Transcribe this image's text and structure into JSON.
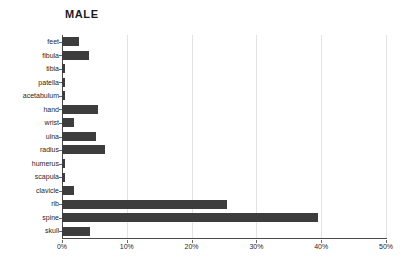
{
  "chart_data": {
    "type": "bar",
    "orientation": "horizontal",
    "title": "MALE",
    "xlabel": "",
    "ylabel": "",
    "xlim": [
      0,
      50
    ],
    "xtick_labels": [
      "0%",
      "10%",
      "20%",
      "30%",
      "40%",
      "50%"
    ],
    "xtick_values": [
      0,
      10,
      20,
      30,
      40,
      50
    ],
    "grid": true,
    "legend": false,
    "bar_color": "#3d3d3d",
    "axis_color": "#4a4a4a",
    "gridline_color": "#e3e3e3",
    "background_color": "#ffffff",
    "value_unit": "percent",
    "categories": [
      "feet",
      "fibula",
      "tibia",
      "patella",
      "acetabulum",
      "hand",
      "wrist",
      "ulna",
      "radius",
      "humerus",
      "scapula",
      "clavicle",
      "rib",
      "spine",
      "skull"
    ],
    "values": [
      2.7,
      4.2,
      0.4,
      0.4,
      0.4,
      5.5,
      1.9,
      5.3,
      6.6,
      0.4,
      0.4,
      1.9,
      25.4,
      39.5,
      4.3
    ]
  }
}
